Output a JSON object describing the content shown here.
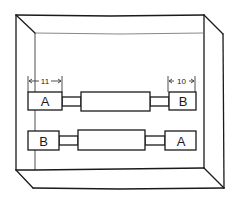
{
  "diagram": {
    "colors": {
      "line": "#1a1a1a",
      "background": "#ffffff"
    },
    "rows": [
      {
        "left_label": "A",
        "right_label": "B",
        "left_dimension": "11",
        "right_dimension": "10"
      },
      {
        "left_label": "B",
        "right_label": "A"
      }
    ]
  }
}
